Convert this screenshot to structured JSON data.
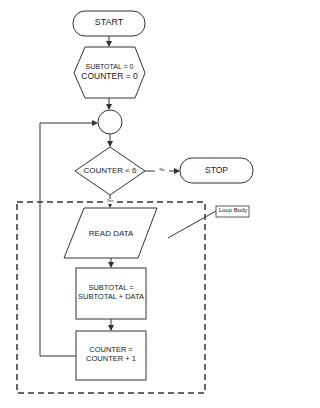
{
  "diagram": {
    "type": "flowchart",
    "nodes": {
      "start": {
        "shape": "terminator",
        "label": "START"
      },
      "init": {
        "shape": "hexagon",
        "line1": "SUBTOTAL = 0",
        "line2": "COUNTER = 0"
      },
      "connector": {
        "shape": "circle",
        "label": ""
      },
      "decision": {
        "shape": "diamond",
        "label": "COUNTER < 6"
      },
      "stop": {
        "shape": "terminator",
        "label": "STOP"
      },
      "read": {
        "shape": "parallelogram",
        "label": "READ DATA"
      },
      "accumulate": {
        "shape": "rectangle",
        "line1": "SUBTOTAL =",
        "line2": "SUBTOTAL + DATA"
      },
      "increment": {
        "shape": "rectangle",
        "line1": "COUNTER =",
        "line2": "COUNTER + 1"
      }
    },
    "edges": {
      "no_label": "No",
      "yes_label": "Yes"
    },
    "annotation": {
      "label": "Loop Body"
    },
    "colors": {
      "stroke": "#333333",
      "text": "#222222",
      "background": "#ffffff"
    }
  }
}
